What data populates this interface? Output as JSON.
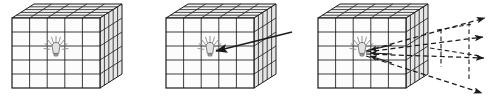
{
  "figure": {
    "title": "",
    "background_color": "#ffffff",
    "line_color": "#1a1a1a",
    "face_fill": "#fdfdfd",
    "side_fill": "#e8e8e8",
    "top_fill": "#f2f2f2",
    "bulb_color": "#7a7a7a",
    "width": 497,
    "height": 103,
    "panel_count": 3
  },
  "panels": [
    {
      "id": "panel-1",
      "name": "voxel-grid-with-source",
      "caption": "",
      "cube": {
        "grid_rows": 5,
        "grid_cols": 5,
        "depth_cells": 5,
        "front_left": 12,
        "front_top": 18,
        "front_width": 88,
        "front_height": 70,
        "depth_dx": 22,
        "depth_dy": -14
      },
      "bulb": {
        "cell_row": 2,
        "cell_col": 2,
        "rays": 9,
        "glow": true
      },
      "annotations": []
    },
    {
      "id": "panel-2",
      "name": "voxel-grid-incident-ray",
      "caption": "",
      "cube": {
        "grid_rows": 5,
        "grid_cols": 5,
        "depth_cells": 5,
        "front_left": 166,
        "front_top": 18,
        "front_width": 88,
        "front_height": 70,
        "depth_dx": 22,
        "depth_dy": -14
      },
      "bulb": {
        "cell_row": 2,
        "cell_col": 2,
        "rays": 9,
        "glow": true
      },
      "annotations": [
        {
          "type": "solid-arrow",
          "name": "incident-ray-arrow",
          "from_x": 292,
          "from_y": 32,
          "to_x": 212,
          "to_y": 52,
          "head": "end"
        }
      ]
    },
    {
      "id": "panel-3",
      "name": "voxel-grid-emitted-rays",
      "caption": "",
      "cube": {
        "grid_rows": 5,
        "grid_cols": 5,
        "depth_cells": 5,
        "front_left": 318,
        "front_top": 18,
        "front_width": 88,
        "front_height": 70,
        "depth_dx": 22,
        "depth_dy": -14
      },
      "bulb": {
        "cell_row": 2,
        "cell_col": 2,
        "rays": 9,
        "glow": true
      },
      "annotations": [
        {
          "type": "dashed-ray",
          "name": "emitted-ray-1",
          "from_x": 364,
          "from_y": 52,
          "to_x": 489,
          "to_y": 17,
          "head": "end"
        },
        {
          "type": "dashed-ray",
          "name": "emitted-ray-2",
          "from_x": 364,
          "from_y": 52,
          "to_x": 487,
          "to_y": 36,
          "head": "end"
        },
        {
          "type": "dashed-ray",
          "name": "emitted-ray-3",
          "from_x": 364,
          "from_y": 54,
          "to_x": 488,
          "to_y": 58,
          "head": "end"
        },
        {
          "type": "dashed-ray",
          "name": "emitted-ray-4",
          "from_x": 364,
          "from_y": 56,
          "to_x": 486,
          "to_y": 95,
          "head": "end"
        },
        {
          "type": "dashed-quad",
          "name": "projection-plane",
          "points": "441,30 470,23 470,78 441,68"
        },
        {
          "type": "inbound-arrow",
          "name": "convergent-arrow-1",
          "from_x": 392,
          "from_y": 45,
          "to_x": 362,
          "to_y": 51
        },
        {
          "type": "inbound-arrow",
          "name": "convergent-arrow-2",
          "from_x": 392,
          "from_y": 54,
          "to_x": 362,
          "to_y": 53
        },
        {
          "type": "inbound-arrow",
          "name": "convergent-arrow-3",
          "from_x": 392,
          "from_y": 63,
          "to_x": 362,
          "to_y": 56
        }
      ]
    }
  ]
}
